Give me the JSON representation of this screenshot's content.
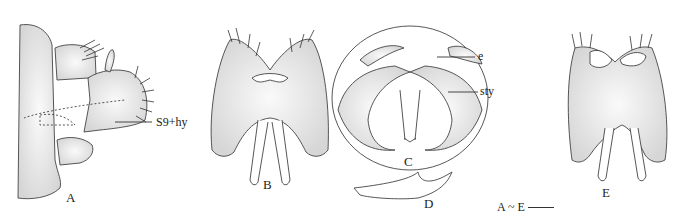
{
  "figure": {
    "panels": [
      {
        "id": "A",
        "label": "A",
        "view": "lateral"
      },
      {
        "id": "B",
        "label": "B",
        "view": "ventral"
      },
      {
        "id": "C",
        "label": "C",
        "view": "caudal"
      },
      {
        "id": "D",
        "label": "D",
        "view": "sclerite"
      },
      {
        "id": "E",
        "label": "E",
        "view": "dorsal"
      }
    ],
    "annotations": {
      "s9hy": "S9+hy",
      "e": "e",
      "sty": "sty"
    },
    "scale_bar": {
      "label": "A ~ E"
    }
  }
}
